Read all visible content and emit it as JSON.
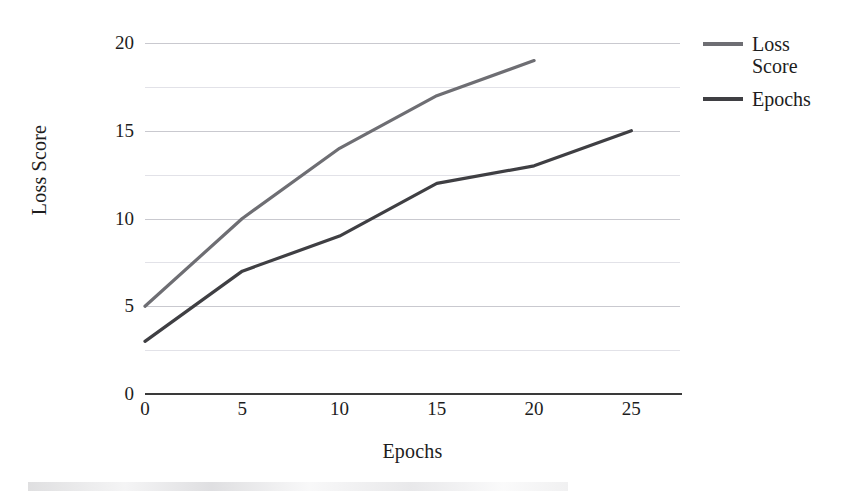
{
  "chart_data": {
    "type": "line",
    "title": "",
    "xlabel": "Epochs",
    "ylabel": "Loss Score",
    "xlim": [
      0,
      27.5
    ],
    "ylim": [
      0,
      20
    ],
    "x_ticks": [
      "0",
      "5",
      "10",
      "15",
      "20",
      "25"
    ],
    "x_tick_values": [
      0,
      5,
      10,
      15,
      20,
      25
    ],
    "y_ticks": [
      "0",
      "5",
      "10",
      "15",
      "20"
    ],
    "y_tick_values": [
      0,
      5,
      10,
      15,
      20
    ],
    "minor_gridline_values": [
      2.5,
      7.5,
      12.5,
      17.5
    ],
    "grid": true,
    "legend_position": "right",
    "series": [
      {
        "name": "Loss Score",
        "color": "#6e6e73",
        "x": [
          0,
          5,
          10,
          15,
          20
        ],
        "values": [
          5,
          10,
          14,
          17,
          19
        ]
      },
      {
        "name": "Epochs",
        "color": "#3f3f43",
        "x": [
          0,
          5,
          10,
          15,
          20,
          25
        ],
        "values": [
          3,
          7,
          9,
          12,
          13,
          15
        ]
      }
    ]
  },
  "legend": {
    "entries": [
      {
        "label": "Loss Score"
      },
      {
        "label": "Epochs"
      }
    ]
  },
  "colors": {
    "axis": "#3a3a3a",
    "gridline_major": "#c9c9cf",
    "gridline_minor": "#e2e2e8",
    "text": "#1d1d1d",
    "background": "#ffffff"
  }
}
